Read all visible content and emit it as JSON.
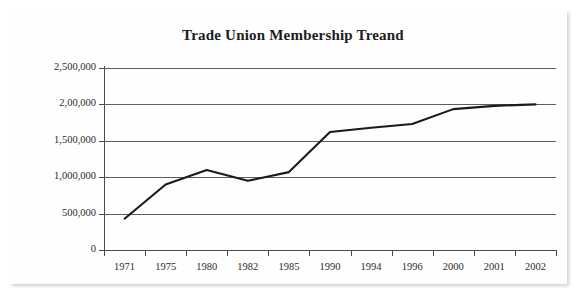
{
  "chart_data": {
    "type": "line",
    "title": "Trade Union Membership Treand",
    "xlabel": "",
    "ylabel": "",
    "categories": [
      "1971",
      "1975",
      "1980",
      "1982",
      "1985",
      "1990",
      "1994",
      "1996",
      "2000",
      "2001",
      "2002"
    ],
    "series": [
      {
        "name": "Trade Union Membership",
        "values": [
          430000,
          900000,
          1100000,
          950000,
          1070000,
          1620000,
          1680000,
          1730000,
          1935000,
          1980000,
          2000000
        ]
      }
    ],
    "ylim": [
      0,
      2500000
    ],
    "y_ticks": [
      0,
      500000,
      1000000,
      1500000,
      2000000,
      2500000
    ],
    "y_tick_labels": [
      "0",
      "500,000",
      "1,000,000",
      "1,500,000",
      "2,00,000",
      "2,500,000"
    ],
    "grid": true,
    "legend": false,
    "legend_position": "none",
    "line_color": "#1a1a1a",
    "grid_color": "#5e5e5e",
    "axis_color": "#4a4a4a",
    "background_color": "#ffffff",
    "markers": false
  }
}
